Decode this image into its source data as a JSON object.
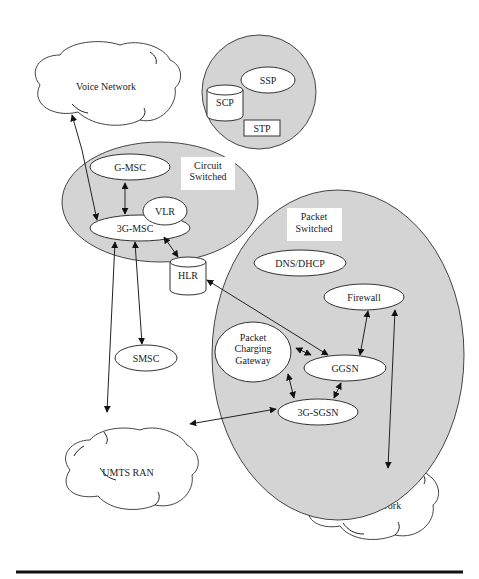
{
  "diagram": {
    "clouds": {
      "voice_network": "Voice Network",
      "umts_ran": "UMTS RAN",
      "data_network": "Data Network"
    },
    "regions": {
      "ss7": {
        "nodes": {
          "scp": "SCP",
          "ssp": "SSP",
          "stp": "STP"
        }
      },
      "circuit_switched": {
        "label_line1": "Circuit",
        "label_line2": "Switched",
        "nodes": {
          "g_msc": "G-MSC",
          "vlr": "VLR",
          "msc_3g": "3G-MSC"
        }
      },
      "packet_switched": {
        "label_line1": "Packet",
        "label_line2": "Switched",
        "nodes": {
          "dns_dhcp": "DNS/DHCP",
          "firewall": "Firewall",
          "pcg_line1": "Packet",
          "pcg_line2": "Charging",
          "pcg_line3": "Gateway",
          "ggsn": "GGSN",
          "sgsn_3g": "3G-SGSN"
        }
      }
    },
    "standalone_nodes": {
      "hlr": "HLR",
      "smsc": "SMSC"
    },
    "connections": [
      {
        "from": "Voice Network",
        "to": "3G-MSC"
      },
      {
        "from": "G-MSC",
        "to": "3G-MSC"
      },
      {
        "from": "3G-MSC",
        "to": "HLR"
      },
      {
        "from": "3G-MSC",
        "to": "SMSC"
      },
      {
        "from": "3G-MSC",
        "to": "UMTS RAN"
      },
      {
        "from": "HLR",
        "to": "GGSN"
      },
      {
        "from": "Firewall",
        "to": "GGSN"
      },
      {
        "from": "Packet Charging Gateway",
        "to": "GGSN"
      },
      {
        "from": "Packet Charging Gateway",
        "to": "3G-SGSN"
      },
      {
        "from": "GGSN",
        "to": "3G-SGSN"
      },
      {
        "from": "3G-SGSN",
        "to": "UMTS RAN"
      },
      {
        "from": "Firewall",
        "to": "Data Network"
      }
    ]
  }
}
